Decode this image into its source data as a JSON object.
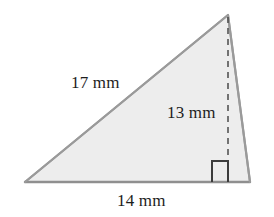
{
  "figure": {
    "kind": "geometry-diagram",
    "shape": "triangle",
    "background_color": "#ffffff",
    "fill_color": "#ededed",
    "stroke_color": "#9a9a9a",
    "dashed_stroke_color": "#4a4a4a",
    "right_angle_color": "#3c3c3c",
    "label_color": "#1d1d1d",
    "unit": "mm",
    "vertices": {
      "apex": {
        "x": 228,
        "y": 15
      },
      "bottom_left": {
        "x": 25,
        "y": 182
      },
      "bottom_right": {
        "x": 250,
        "y": 182
      }
    },
    "altitude": {
      "from": {
        "x": 228,
        "y": 15
      },
      "to": {
        "x": 228,
        "y": 182
      },
      "style": "dashed"
    },
    "right_angle_marker": {
      "x": 212,
      "y": 161,
      "size": 16
    },
    "labels": {
      "hypotenuse": "17 mm",
      "height": "13 mm",
      "base": "14 mm"
    }
  },
  "measurements": {
    "slant_side": 17,
    "height": 13,
    "base": 14
  }
}
